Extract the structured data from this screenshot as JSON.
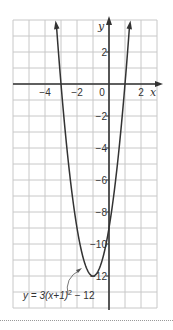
{
  "chart_data": {
    "type": "line",
    "title": "",
    "xlabel": "x",
    "ylabel": "y",
    "xlim": [
      -6,
      3
    ],
    "ylim": [
      -14,
      4
    ],
    "grid": true,
    "x_ticks": [
      {
        "value": -4,
        "label": "−4"
      },
      {
        "value": -2,
        "label": "−2"
      },
      {
        "value": 0,
        "label": "0"
      },
      {
        "value": 2,
        "label": "2"
      }
    ],
    "y_ticks": [
      {
        "value": 2,
        "label": "2"
      },
      {
        "value": -2,
        "label": "−2"
      },
      {
        "value": -4,
        "label": "−4"
      },
      {
        "value": -6,
        "label": "−6"
      },
      {
        "value": -8,
        "label": "−8"
      },
      {
        "value": -10,
        "label": "−10"
      },
      {
        "value": -12,
        "label": "−12"
      }
    ],
    "series": [
      {
        "name": "y = 3(x+1)² − 12",
        "function": "3*(x+1)^2-12",
        "vertex": [
          -1,
          -12
        ],
        "x_intercepts": [
          -3,
          1
        ],
        "y_intercept": -9,
        "x": [
          -3.3,
          -3,
          -2.5,
          -2,
          -1.5,
          -1,
          -0.5,
          0,
          0.5,
          1,
          1.3
        ],
        "values": [
          3.87,
          0,
          -5.25,
          -9,
          -11.25,
          -12,
          -11.25,
          -9,
          -5.25,
          0,
          3.87
        ]
      }
    ],
    "annotation": {
      "text_prefix": "y = 3(x+1)",
      "superscript": "2",
      "text_suffix": " − 12"
    },
    "colors": {
      "grid": "#c8c8c8",
      "axis": "#333333",
      "curve": "#333333"
    }
  }
}
